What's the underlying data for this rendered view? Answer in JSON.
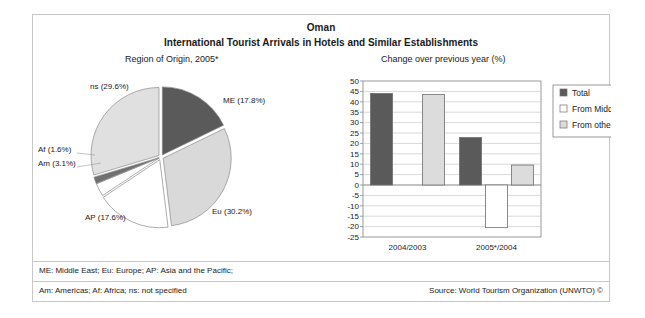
{
  "figure": {
    "title": "Oman",
    "subtitle": "International Tourist Arrivals in Hotels and Similar Establishments",
    "pie_panel_title": "Region of Origin, 2005*",
    "bar_panel_title": "Change over previous year (%)"
  },
  "footer": {
    "note_line1": "ME: Middle East; Eu: Europe; AP: Asia and the Pacific;",
    "note_line2": "Am: Americas; Af: Africa; ns: not specified",
    "source": "Source: World Tourism Organization (UNWTO) ©"
  },
  "colors": {
    "dark_gray": "#5a5a5a",
    "light_gray": "#d9d9d9",
    "white": "#ffffff",
    "frame": "#c8c8c8",
    "gridline": "#bfbfbf",
    "axis": "#808080",
    "text": "#1a1a1a"
  },
  "chart_data": [
    {
      "type": "pie",
      "title": "Region of Origin, 2005*",
      "legend": "labels-on-slices",
      "grid": false,
      "categories": [
        "ME",
        "Eu",
        "AP",
        "Am",
        "Af",
        "ns"
      ],
      "values": [
        17.8,
        30.2,
        17.6,
        3.1,
        1.6,
        29.6
      ],
      "labels": [
        "ME (17.8%)",
        "Eu (30.2%)",
        "AP (17.6%)",
        "Am (3.1%)",
        "Af (1.6%)",
        "ns (29.6%)"
      ],
      "slice_colors": [
        "#5a5a5a",
        "#d9d9d9",
        "#ffffff",
        "#ffffff",
        "#707070",
        "#e0e0e0"
      ],
      "units": "percent"
    },
    {
      "type": "bar",
      "title": "Change over previous year (%)",
      "xlabel": "",
      "ylabel": "",
      "ylim": [
        -25,
        50
      ],
      "ytick_step": 5,
      "grid": true,
      "legend_position": "right",
      "categories": [
        "2004/2003",
        "2005*/2004"
      ],
      "yticks": [
        50,
        45,
        40,
        35,
        30,
        25,
        20,
        15,
        10,
        5,
        0,
        -5,
        -10,
        -15,
        -20,
        -25
      ],
      "series": [
        {
          "name": "Total",
          "values": [
            44.0,
            22.8
          ],
          "color": "#5a5a5a"
        },
        {
          "name": "From Middle East",
          "values": [
            null,
            -20.5
          ],
          "color": "#ffffff"
        },
        {
          "name": "From other regions",
          "values": [
            43.5,
            9.6
          ],
          "color": "#dcdcdc"
        }
      ]
    }
  ]
}
